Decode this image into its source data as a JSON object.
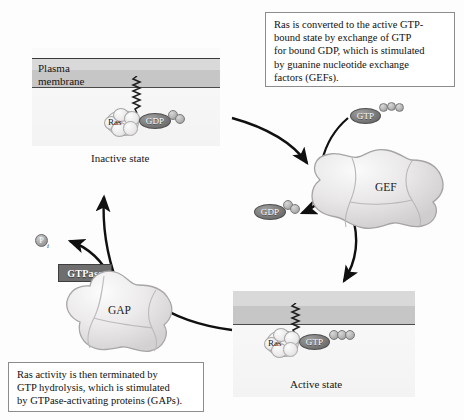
{
  "diagram": {
    "colors": {
      "membrane_outer": "#d9d9d9",
      "membrane_inner": "#c6c6c6",
      "nucleotide_fill": "#7b7b7b",
      "protein_fill": "#eceaea",
      "tag_fill": "#6e6e6e",
      "callout_border": "#8c8c8c"
    }
  },
  "callouts": [
    {
      "id": "gef-callout",
      "text": "Ras is converted to the active GTP-\nbound state by exchange of GTP\nfor bound GDP, which is stimulated\nby guanine nucleotide exchange\nfactors (GEFs)."
    },
    {
      "id": "gap-callout",
      "text": "Ras activity is then terminated by\nGTP hydrolysis, which is stimulated\nby GTPase-activating proteins (GAPs)."
    }
  ],
  "panels": {
    "inactive": {
      "membrane_label": "Plasma\nmembrane",
      "state_label": "Inactive state",
      "ras_label": "Ras",
      "nucleotide_label": "GDP",
      "phosphate_count": 2
    },
    "active": {
      "membrane_label": "",
      "state_label": "Active state",
      "ras_label": "Ras",
      "nucleotide_label": "GTP",
      "phosphate_count": 3
    }
  },
  "proteins": {
    "gef": {
      "name": "GEF",
      "incoming_nucleotide": {
        "label": "GTP",
        "phosphate_count": 3
      },
      "outgoing_nucleotide": {
        "label": "GDP",
        "phosphate_count": 2
      }
    },
    "gap": {
      "name": "GAP",
      "tag_label": "GTPase",
      "released_product": {
        "label": "P",
        "subscript": "i"
      }
    }
  }
}
